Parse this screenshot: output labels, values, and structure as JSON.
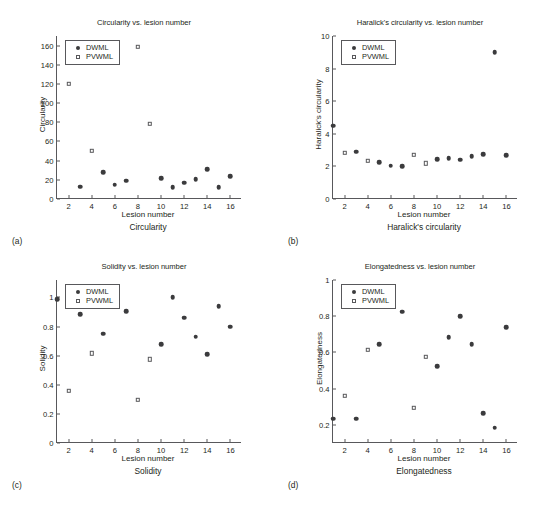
{
  "figure": {
    "background": "#ffffff",
    "marker_color": "#3b3b3d",
    "axis_color": "#58585b",
    "text_color": "#231f20"
  },
  "panels": [
    {
      "letter": "(a)",
      "caption": "Circularity",
      "chart_data": {
        "type": "scatter",
        "title": "Circularity vs. lesion number",
        "xlabel": "Lesion number",
        "ylabel": "Circularity",
        "xlim": [
          1,
          17
        ],
        "ylim": [
          0,
          170
        ],
        "xticks": [
          2,
          4,
          6,
          8,
          10,
          12,
          14,
          16
        ],
        "yticks": [
          0,
          20,
          40,
          60,
          80,
          100,
          120,
          140,
          160
        ],
        "grid": false,
        "legend_position": "upper left",
        "series": [
          {
            "name": "DWML",
            "marker": "filled-circle",
            "x": [
              3,
              5,
              6,
              7,
              10,
              11,
              12,
              13,
              14,
              15,
              16
            ],
            "y": [
              13,
              28,
              15,
              19,
              21.5,
              12,
              17,
              20.5,
              31,
              12,
              23.5
            ]
          },
          {
            "name": "PVWML",
            "marker": "open-square",
            "x": [
              2,
              4,
              8,
              9
            ],
            "y": [
              120,
              50,
              159,
              78.5
            ]
          }
        ]
      }
    },
    {
      "letter": "(b)",
      "caption": "Haralick's circularity",
      "chart_data": {
        "type": "scatter",
        "title": "Haralick's circularity vs. lesion number",
        "xlabel": "Lesion number",
        "ylabel": "Haralick's circularity",
        "xlim": [
          1,
          17
        ],
        "ylim": [
          0,
          10
        ],
        "xticks": [
          2,
          4,
          6,
          8,
          10,
          12,
          14,
          16
        ],
        "yticks": [
          0,
          2,
          4,
          6,
          8,
          10
        ],
        "grid": false,
        "legend_position": "upper left",
        "series": [
          {
            "name": "DWML",
            "marker": "filled-circle",
            "x": [
              1,
              3,
              5,
              6,
              7,
              10,
              11,
              12,
              13,
              14,
              15,
              16
            ],
            "y": [
              4.5,
              2.9,
              2.25,
              2.05,
              2.0,
              2.45,
              2.5,
              2.4,
              2.62,
              2.75,
              9.0,
              2.7
            ]
          },
          {
            "name": "PVWML",
            "marker": "open-square",
            "x": [
              2,
              4,
              8,
              9
            ],
            "y": [
              2.85,
              2.35,
              2.7,
              2.2
            ]
          }
        ]
      }
    },
    {
      "letter": "(c)",
      "caption": "Solidity",
      "chart_data": {
        "type": "scatter",
        "title": "Solidity vs. lesion number",
        "xlabel": "Lesion number",
        "ylabel": "Solidity",
        "xlim": [
          1,
          17
        ],
        "ylim": [
          0,
          1.12
        ],
        "xticks": [
          2,
          4,
          6,
          8,
          10,
          12,
          14,
          16
        ],
        "yticks": [
          0,
          0.2,
          0.4,
          0.6,
          0.8,
          1
        ],
        "ytick_labels": [
          "0",
          "0.2",
          "0.4",
          "0.6",
          "0.8",
          "1"
        ],
        "grid": false,
        "legend_position": "upper left",
        "series": [
          {
            "name": "DWML",
            "marker": "filled-circle",
            "x": [
              1,
              3,
              5,
              6,
              7,
              10,
              11,
              12,
              13,
              14,
              15,
              16
            ],
            "y": [
              0.99,
              0.885,
              0.75,
              1.0,
              0.905,
              0.68,
              1.0,
              0.86,
              0.73,
              0.61,
              0.94,
              0.8
            ]
          },
          {
            "name": "PVWML",
            "marker": "open-square",
            "x": [
              2,
              4,
              8,
              9
            ],
            "y": [
              0.36,
              0.615,
              0.295,
              0.575
            ]
          }
        ]
      }
    },
    {
      "letter": "(d)",
      "caption": "Elongatedness",
      "chart_data": {
        "type": "scatter",
        "title": "Elongatedness vs. lesion number",
        "xlabel": "Lesion number",
        "ylabel": "Elongatedness",
        "xlim": [
          1,
          17
        ],
        "ylim": [
          0.1,
          1.0
        ],
        "xticks": [
          2,
          4,
          6,
          8,
          10,
          12,
          14,
          16
        ],
        "yticks": [
          0.2,
          0.4,
          0.6,
          0.8,
          1
        ],
        "ytick_labels": [
          "0.2",
          "0.4",
          "0.6",
          "0.8",
          "1"
        ],
        "grid": false,
        "legend_position": "upper left",
        "series": [
          {
            "name": "DWML",
            "marker": "filled-circle",
            "x": [
              1,
              3,
              5,
              6,
              7,
              10,
              11,
              12,
              13,
              14,
              15,
              16
            ],
            "y": [
              0.235,
              0.235,
              0.645,
              0.895,
              0.825,
              0.525,
              0.685,
              0.8,
              0.645,
              0.265,
              0.185,
              0.74
            ]
          },
          {
            "name": "PVWML",
            "marker": "open-square",
            "x": [
              2,
              4,
              8,
              9
            ],
            "y": [
              0.36,
              0.615,
              0.295,
              0.575
            ]
          }
        ]
      }
    }
  ],
  "legend": {
    "entries": [
      {
        "label": "DWML",
        "marker": "filled-circle"
      },
      {
        "label": "PVWML",
        "marker": "open-square"
      }
    ]
  }
}
